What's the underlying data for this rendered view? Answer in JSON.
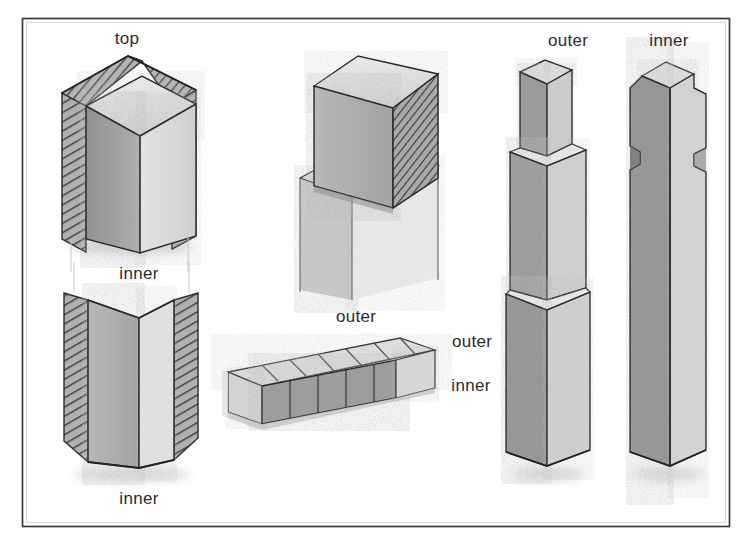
{
  "figure": {
    "domain": "Diagram",
    "medium": "scanned halftone line drawing",
    "frame": {
      "name": "illustration-border",
      "x": 22,
      "y": 18,
      "width": 708,
      "height": 509,
      "stroke_color": "#3a3a3a",
      "stroke_width": 1.6,
      "fill_color": "#ffffff"
    },
    "background_color": "#ffffff",
    "palette": {
      "paper": "#ffffff",
      "line": "#2b2b2b",
      "hatch": "#4a4a4a",
      "face_dark": "#9a9a9a",
      "face_mid": "#bcbcbc",
      "face_light": "#dcdcdc",
      "face_top": "#e4e4e4",
      "shadow": "#c9c9c9",
      "text": "#2b2b2b"
    }
  },
  "labels": [
    {
      "id": "top-left-post",
      "text": "top",
      "x": 127,
      "y": 44,
      "anchor": "middle"
    },
    {
      "id": "inner-mid-left",
      "text": "inner",
      "x": 139,
      "y": 279,
      "anchor": "middle"
    },
    {
      "id": "inner-bottom-left",
      "text": "inner",
      "x": 139,
      "y": 504,
      "anchor": "middle"
    },
    {
      "id": "outer-slab",
      "text": "outer",
      "x": 356,
      "y": 322,
      "anchor": "middle"
    },
    {
      "id": "outer-right-callout",
      "text": "outer",
      "x": 472,
      "y": 347,
      "anchor": "middle"
    },
    {
      "id": "inner-right-callout",
      "text": "inner",
      "x": 471,
      "y": 391,
      "anchor": "middle"
    },
    {
      "id": "outer-right-post",
      "text": "outer",
      "x": 568,
      "y": 46,
      "anchor": "middle"
    },
    {
      "id": "inner-right-post",
      "text": "inner",
      "x": 669,
      "y": 46,
      "anchor": "middle"
    }
  ],
  "figures": [
    {
      "id": "post-section-upper-left",
      "name": "hollow-post-upper-section",
      "description": "Square post upper section shown in cutaway: cross-hatched outer shell with solid inner core visible.",
      "bbox": [
        55,
        52,
        145,
        195
      ],
      "label_ref": "top-left-post"
    },
    {
      "id": "post-section-lower-left",
      "name": "hollow-post-lower-section",
      "description": "Matching lower section of the same post, open V corner showing inner core faces and hatched shell walls.",
      "bbox": [
        55,
        290,
        145,
        190
      ],
      "label_ref": "inner-bottom-left"
    },
    {
      "id": "exploded-cap-joint",
      "name": "exploded-post-cap-joint",
      "description": "Exploded isometric of a post cap block lifted off the post body; right face cross-hatched end grain.",
      "bbox": [
        285,
        52,
        165,
        235
      ]
    },
    {
      "id": "laminated-slab",
      "name": "laminated-board-assembly",
      "description": "Low isometric view of a laminated board/plank showing the segmented top lamination over the darker core strip.",
      "bbox": [
        222,
        338,
        205,
        110
      ],
      "label_refs": [
        "outer-slab",
        "outer-right-callout",
        "inner-right-callout"
      ]
    },
    {
      "id": "outer-post",
      "name": "outer-post-with-tenon",
      "description": "Tall outer post with a square stepped tenon at the top and a shouldered collar partway down.",
      "bbox": [
        508,
        58,
        80,
        420
      ],
      "label_ref": "outer-right-post"
    },
    {
      "id": "inner-post",
      "name": "inner-post-with-notches",
      "description": "Tall inner post of matching length with notched shoulders cut into both side faces.",
      "bbox": [
        625,
        58,
        80,
        420
      ],
      "label_ref": "inner-right-post"
    }
  ]
}
